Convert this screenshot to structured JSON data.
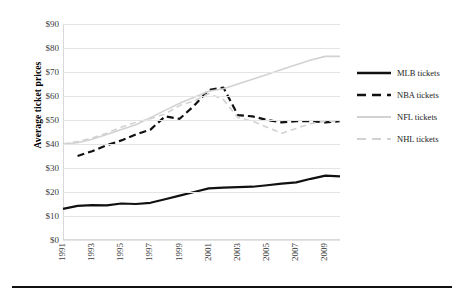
{
  "chart_data": {
    "type": "line",
    "title": "",
    "xlabel": "",
    "ylabel": "Average ticket prices",
    "ylim": [
      0,
      90
    ],
    "ytick_labels": [
      "$90",
      "$80",
      "$70",
      "$60",
      "$50",
      "$40",
      "$30",
      "$20",
      "$10",
      "$0"
    ],
    "ytick_values": [
      90,
      80,
      70,
      60,
      50,
      40,
      30,
      20,
      10,
      0
    ],
    "xlim": [
      1991,
      2010
    ],
    "x": [
      1991,
      1992,
      1993,
      1994,
      1995,
      1996,
      1997,
      1998,
      1999,
      2000,
      2001,
      2002,
      2003,
      2004,
      2005,
      2006,
      2007,
      2008,
      2009,
      2010
    ],
    "xtick_labels": [
      "1991",
      "1993",
      "1995",
      "1997",
      "1999",
      "2001",
      "2003",
      "2005",
      "2007",
      "2009"
    ],
    "xtick_values": [
      1991,
      1993,
      1995,
      1997,
      1999,
      2001,
      2003,
      2005,
      2007,
      2009
    ],
    "grid": true,
    "legend_position": "right",
    "series": [
      {
        "name": "MLB tickets",
        "color": "#111111",
        "style": "solid",
        "width": 2.2,
        "x": [
          1991,
          1992,
          1993,
          1994,
          1995,
          1996,
          1997,
          1998,
          1999,
          2000,
          2001,
          2002,
          2003,
          2004,
          2005,
          2006,
          2007,
          2008,
          2009,
          2010
        ],
        "values": [
          13.0,
          14.2,
          14.5,
          14.4,
          15.2,
          15.0,
          15.5,
          17.0,
          18.5,
          20.0,
          21.5,
          21.8,
          22.0,
          22.2,
          22.8,
          23.5,
          24.0,
          25.5,
          26.8,
          26.5
        ]
      },
      {
        "name": "NBA tickets",
        "color": "#111111",
        "style": "dashed",
        "width": 2.2,
        "x": [
          1992,
          1993,
          1994,
          1995,
          1996,
          1997,
          1998,
          1999,
          2000,
          2001,
          2002,
          2003,
          2004,
          2005,
          2006,
          2007,
          2008,
          2009,
          2010
        ],
        "values": [
          35.0,
          37.0,
          39.5,
          41.5,
          44.0,
          46.0,
          51.5,
          50.5,
          56.0,
          62.5,
          63.5,
          52.0,
          51.5,
          50.0,
          49.0,
          49.5,
          49.5,
          49.0,
          49.5
        ]
      },
      {
        "name": "NFL tickets",
        "color": "#d2d2d2",
        "style": "solid",
        "width": 1.6,
        "x": [
          1991,
          1992,
          1993,
          1994,
          1995,
          1996,
          1997,
          1998,
          1999,
          2000,
          2001,
          2002,
          2003,
          2004,
          2005,
          2006,
          2007,
          2008,
          2009,
          2010
        ],
        "values": [
          40.0,
          40.5,
          42.0,
          44.0,
          46.0,
          48.0,
          51.0,
          54.0,
          57.0,
          59.5,
          62.0,
          63.0,
          65.0,
          67.0,
          69.0,
          71.0,
          73.0,
          75.0,
          76.5,
          76.5
        ]
      },
      {
        "name": "NHL tickets",
        "color": "#d2d2d2",
        "style": "dashed",
        "width": 1.6,
        "x": [
          1991,
          1992,
          1993,
          1994,
          1995,
          1996,
          1997,
          1998,
          1999,
          2000,
          2001,
          2002,
          2003,
          2004,
          2006,
          2007,
          2008,
          2009,
          2010
        ],
        "values": [
          40.0,
          41.0,
          42.5,
          44.5,
          47.0,
          49.0,
          50.5,
          52.5,
          56.0,
          58.0,
          61.0,
          58.5,
          51.0,
          49.5,
          44.5,
          46.5,
          48.5,
          49.5,
          49.5
        ]
      }
    ]
  },
  "legend": {
    "items": [
      {
        "label": "MLB tickets"
      },
      {
        "label": "NBA tickets"
      },
      {
        "label": "NFL tickets"
      },
      {
        "label": "NHL tickets"
      }
    ]
  },
  "axis": {
    "y_title": "Average ticket prices"
  }
}
